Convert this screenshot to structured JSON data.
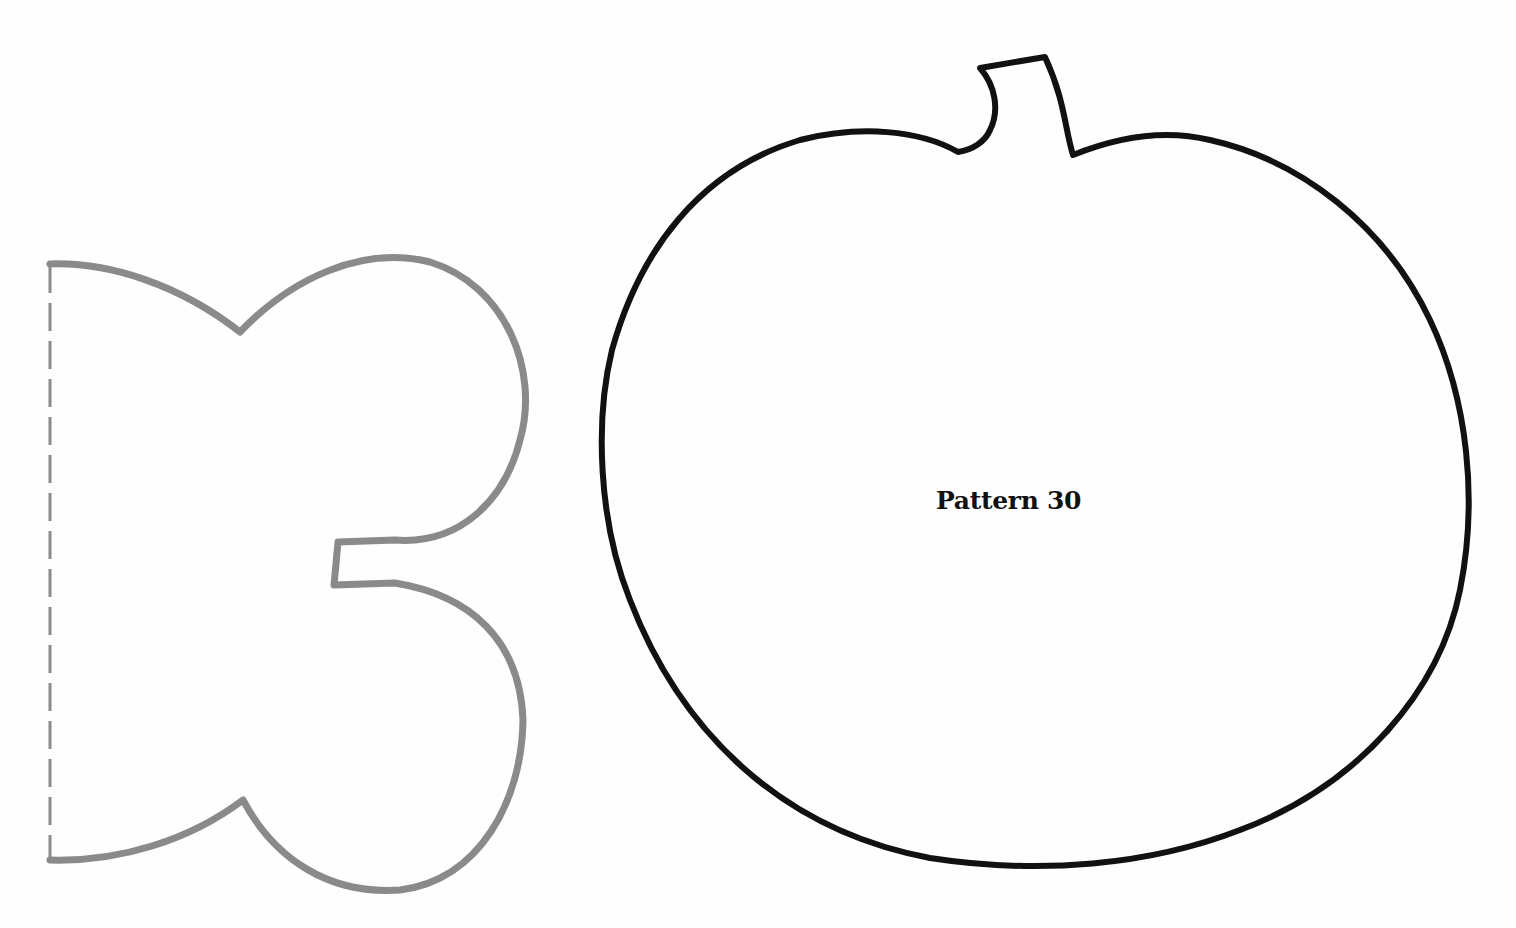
{
  "page": {
    "background": "#fefefe"
  },
  "patterns": {
    "pumpkin": {
      "label": "Pattern 30",
      "outline_color": "#111111"
    },
    "half_template": {
      "outline_color": "#888888",
      "fold_line": "dashed"
    }
  }
}
